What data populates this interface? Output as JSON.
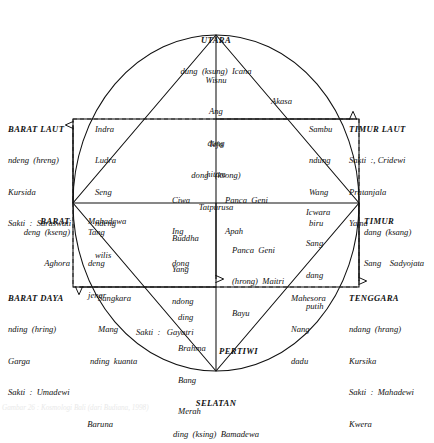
{
  "figure": {
    "type": "cosmological-diagram",
    "title_caption": "Gambar 26 : Kosmologi Bali (dari Budiana, 1998)"
  },
  "cardinal": {
    "utara": {
      "name": "UTARA",
      "lines": [
        "dung  (ksung)  Icana"
      ]
    },
    "timur_laut": {
      "name": "TIMUR LAUT",
      "lines": [
        "Sakti  :, Cridewi",
        "Pratanjala",
        "Yama"
      ]
    },
    "timur": {
      "name": "TIMUR",
      "lines": [
        "dang  (ksang)",
        "Sang    Sadyojata"
      ]
    },
    "tenggara": {
      "name": "TENGGARA",
      "lines": [
        "ndang  (hrang)",
        "Kursika",
        "Sakti  :  Mahadewi",
        "Kwera"
      ]
    },
    "selatan": {
      "name": "SELATAN",
      "lines": [
        "ding  (ksing)  Bamadewa"
      ]
    },
    "barat_daya": {
      "name": "BARAT DAYA",
      "lines": [
        "nding  (hring)",
        "Garga",
        "Sakti  :  Umadewi",
        "Baruna"
      ]
    },
    "barat": {
      "name": "BARAT",
      "lines": [
        "deng  (kseng)",
        "Aghora"
      ]
    },
    "barat_laut": {
      "name": "BARAT LAUT",
      "lines": [
        "ndeng  (hreng)",
        "Kursida",
        "Sakti  :  Saraswati"
      ]
    }
  },
  "deities": {
    "wisnu": [
      "Wisnu",
      "Ang",
      "dung",
      "hitam"
    ],
    "sambu": [
      "Sambu",
      "ndung",
      "Wang",
      "biru"
    ],
    "icwara": [
      "Icwara",
      "Sang",
      "dang",
      "putih"
    ],
    "mahesora": [
      "Mahesora",
      "Nang",
      "dadu"
    ],
    "brahma": [
      "ding",
      "Brahma",
      "Bang",
      "Merah"
    ],
    "sangkara": [
      "Sangkara",
      "Mang",
      "nding  kuanta"
    ],
    "mahadewa": [
      "Mahadewa",
      "Tang",
      "deng",
      "jenar"
    ],
    "ludra": [
      "Indra",
      "Ludra",
      "Seng",
      "ndeng",
      "wilis"
    ],
    "ciwa": [
      "Ciwa",
      "Ing",
      "dong"
    ],
    "buddha": [
      "Buddha",
      "Yang",
      "ndong",
      "Sakti  :   Gayatri"
    ]
  },
  "elements": {
    "akasa": "Akasa",
    "teja": [
      "Teja",
      "dong   (ksong)",
      "Tatpurusa"
    ],
    "apah": [
      "Panca  Geni",
      "Apah"
    ],
    "bayu": [
      "Panca  Geni",
      "(hrong)  Maitri",
      "Bayu"
    ],
    "pertiwi": "PERTIWI"
  },
  "colors": {
    "ink": "#111111",
    "paper": "#ffffff",
    "dashed": "#333333"
  }
}
